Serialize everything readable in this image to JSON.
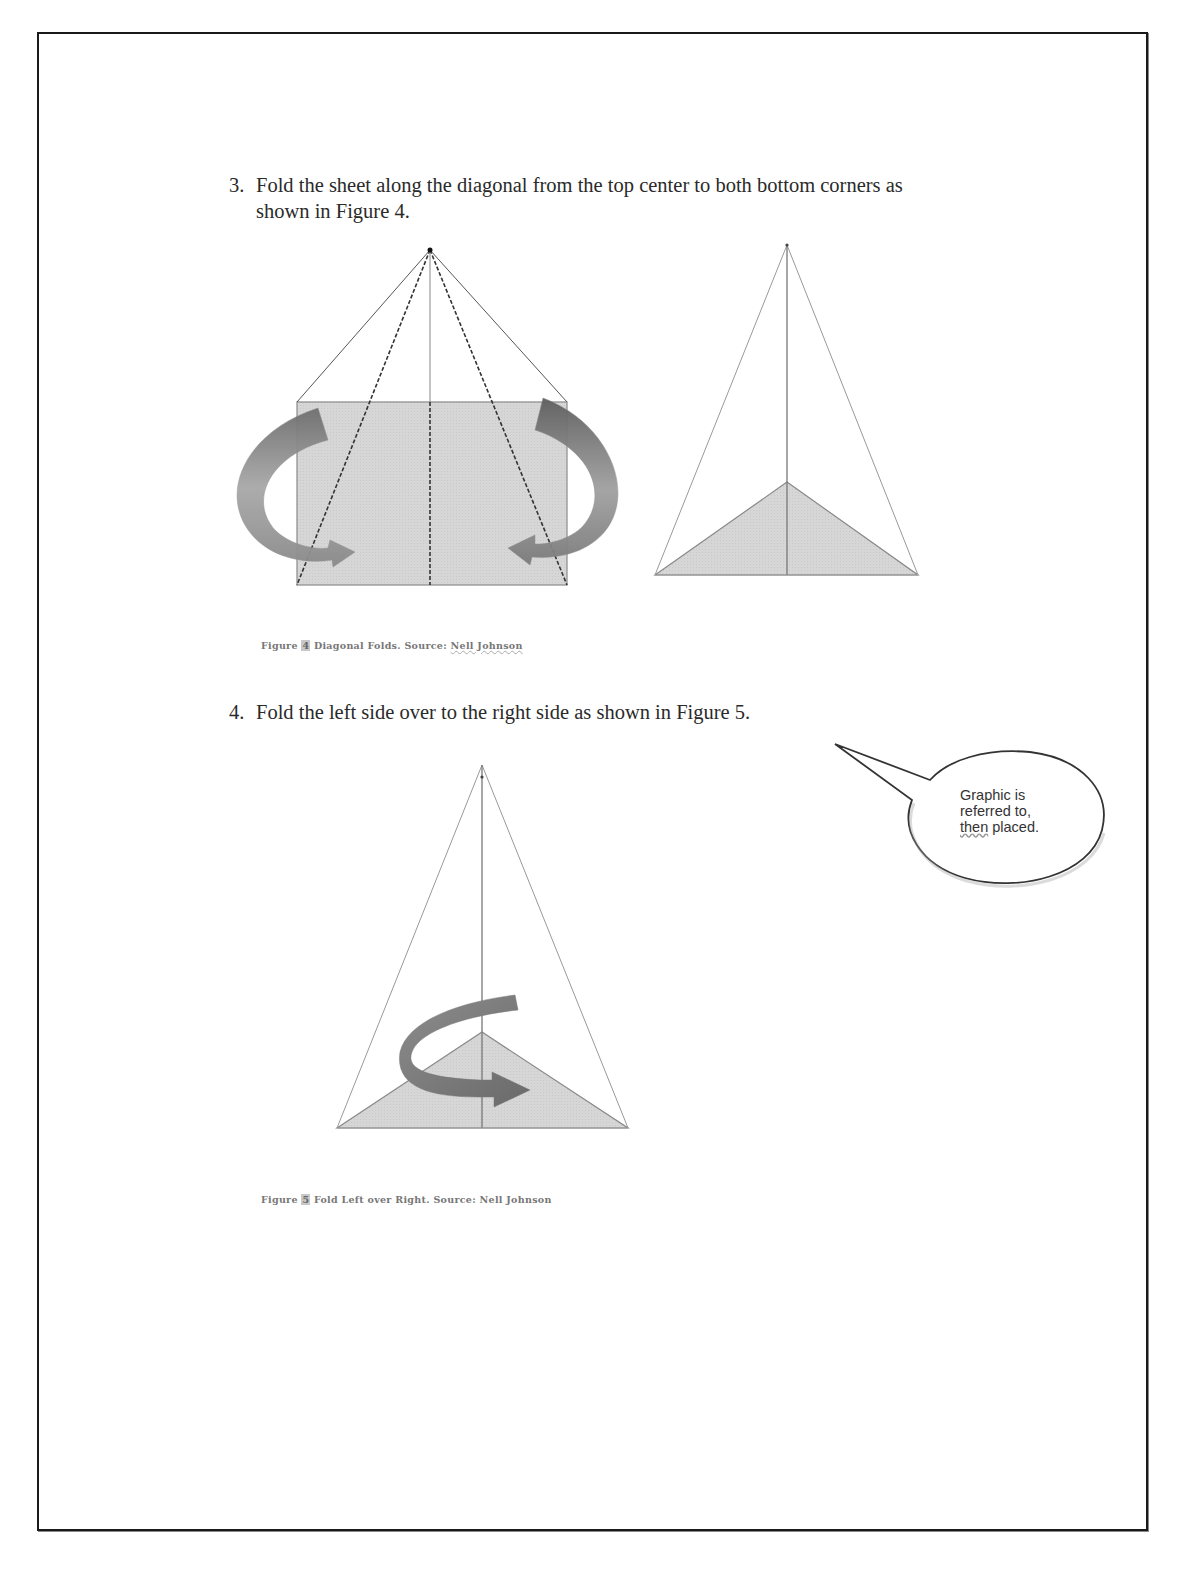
{
  "document": {
    "steps": [
      {
        "number": "3.",
        "text": "Fold the sheet along the diagonal from the top center to both bottom corners as shown in Figure 4."
      },
      {
        "number": "4.",
        "text": "Fold the left side over to the right side as shown in Figure 5."
      }
    ],
    "figures": [
      {
        "label": "Figure",
        "number": "4",
        "title": "Diagonal Folds. Source:",
        "author": "Nell Johnson",
        "panels": [
          "rectangle-with-diagonal-fold-lines-and-arrows",
          "folded-triangle"
        ]
      },
      {
        "label": "Figure",
        "number": "5",
        "title": "Fold Left over Right. Source:",
        "author": "Nell Johnson",
        "panels": [
          "triangle-with-curved-fold-arrow"
        ]
      }
    ],
    "callout": {
      "line1": "Graphic is",
      "line2": "referred to,",
      "line3_a": "then",
      "line3_b": " placed."
    },
    "colors": {
      "paper_fill": "#d4d4d4",
      "arrow_dark": "#7a7a7a",
      "arrow_light": "#b5b5b5",
      "line": "#555555",
      "border": "#1a1a1a"
    }
  }
}
